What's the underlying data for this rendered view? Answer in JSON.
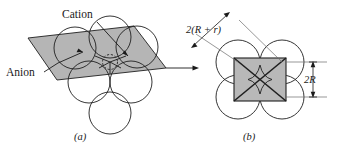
{
  "figure": {
    "background_color": "#ffffff",
    "line_color": "#1f1f1f",
    "shade_color": "#b5b5b5",
    "square_shade_color": "#b8b8b8",
    "panels": [
      {
        "id": "a",
        "caption": "(a)",
        "labels": [
          {
            "name": "cation",
            "text": "Cation"
          },
          {
            "name": "anion",
            "text": "Anion"
          }
        ]
      },
      {
        "id": "b",
        "caption": "(b)",
        "labels": [
          {
            "name": "edge-dimension",
            "text": "2(R + r)"
          },
          {
            "name": "height-dimension",
            "text": "2R"
          }
        ]
      }
    ],
    "connector": {
      "name": "panel-connector-arrow",
      "direction": "left-to-right"
    },
    "dimension_edge": "2(R + r)",
    "dimension_height": "2R"
  }
}
